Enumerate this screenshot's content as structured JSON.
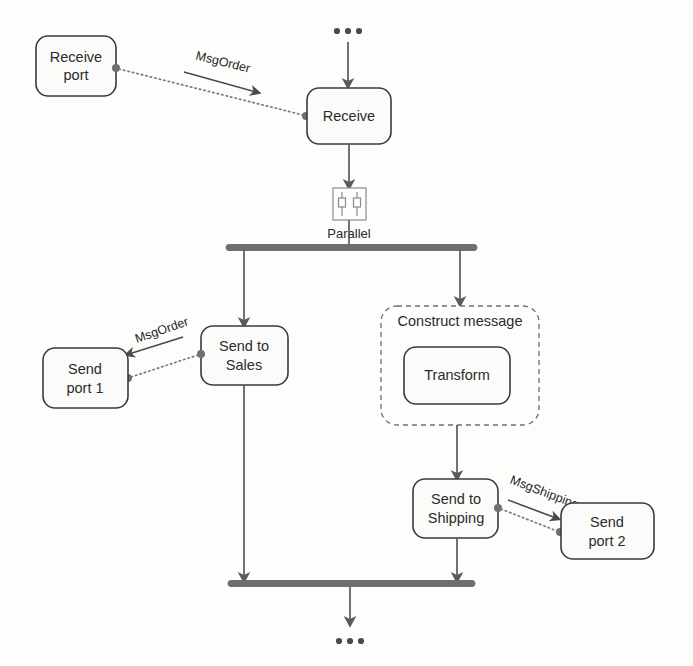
{
  "diagram": {
    "type": "orchestration-flow",
    "colors": {
      "node_stroke": "#3a3a3a",
      "node_fill": "#fbfbfa",
      "flow_line": "#5a5a5a",
      "bar": "#6e6e6e",
      "message_line": "#7a7a7a",
      "group_stroke": "#6f6f6f",
      "text": "#2b2b2b",
      "canvas": "#fdfdfc"
    },
    "nodes": {
      "receive_port": {
        "label_line1": "Receive",
        "label_line2": "port"
      },
      "receive": {
        "label_line1": "Receive"
      },
      "parallel_icon": {
        "caption": "Parallel",
        "icon": "parallel-shape-icon"
      },
      "send_to_sales": {
        "label_line1": "Send to",
        "label_line2": "Sales"
      },
      "send_port_1": {
        "label_line1": "Send",
        "label_line2": "port 1"
      },
      "construct_message": {
        "label": "Construct message"
      },
      "transform": {
        "label_line1": "Transform"
      },
      "send_to_shipping": {
        "label_line1": "Send to",
        "label_line2": "Shipping"
      },
      "send_port_2": {
        "label_line1": "Send",
        "label_line2": "port 2"
      }
    },
    "messages": {
      "msg_order_top": {
        "label": "MsgOrder",
        "direction": "to-receive"
      },
      "msg_order_sales": {
        "label": "MsgOrder",
        "direction": "to-send-port-1"
      },
      "msg_shipping": {
        "label": "MsgShipping",
        "direction": "to-send-port-2"
      }
    },
    "continuation": {
      "top_ellipsis": "•••",
      "bottom_ellipsis": "•••"
    },
    "bars": {
      "fork_label": "parallel-fork-bar",
      "join_label": "parallel-join-bar"
    }
  }
}
